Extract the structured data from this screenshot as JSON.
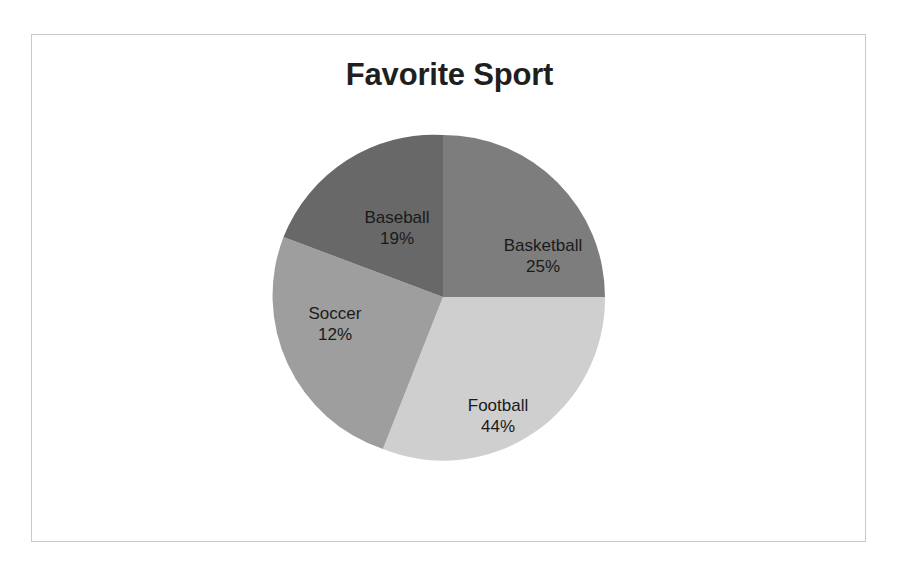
{
  "chart_data": {
    "type": "pie",
    "title": "Favorite Sport",
    "categories": [
      "Basketball",
      "Football",
      "Soccer",
      "Baseball"
    ],
    "values": [
      25,
      44,
      12,
      19
    ],
    "value_unit": "%",
    "labels": [
      {
        "name": "Basketball",
        "value": "25%"
      },
      {
        "name": "Football",
        "value": "44%"
      },
      {
        "name": "Soccer",
        "value": "12%"
      },
      {
        "name": "Baseball",
        "value": "19%"
      }
    ],
    "colors": [
      "#7d7d7d",
      "#cfcfcf",
      "#9e9e9e",
      "#686868"
    ],
    "start_angle_deg": 0,
    "direction": "clockwise",
    "legend": "none",
    "data_labels": "inside-slice",
    "grid": false,
    "xlabel": "",
    "ylabel": ""
  },
  "frame": {
    "border_color": "#c9c9c9",
    "background": "#ffffff"
  },
  "title": {
    "text": "Favorite Sport",
    "color": "#1f1f1f"
  },
  "slices": {
    "basketball": {
      "name": "Basketball",
      "value": "25%",
      "color": "#7d7d7d",
      "path": "M 175,175 L 175,13 A 162,162 0 0 1 337,175 Z"
    },
    "football": {
      "name": "Football",
      "value": "44%",
      "color": "#cfcfcf",
      "path": "M 175,175 L 337,175 A 162,162 0 0 1 114.9,327.1 Z"
    },
    "soccer": {
      "name": "Soccer",
      "value": "12%",
      "color": "#9e9e9e",
      "path": "M 175,175 L 114.9,327.1 A 162,162 0 0 1 15.5,115.0 Z"
    },
    "baseball": {
      "name": "Baseball",
      "value": "19%",
      "color": "#686868",
      "path": "M 175,175 L 15.5,115.0 A 162,162 0 0 1 175,13 Z"
    }
  }
}
